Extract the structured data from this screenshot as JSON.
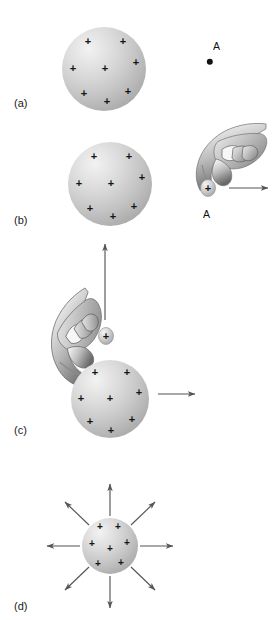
{
  "figure": {
    "background_color": "#ffffff",
    "sphere_light_color": "#f2f2f2",
    "sphere_dark_color": "#9a9a9a",
    "ink_color": "#141414",
    "arrow_color": "#555555"
  },
  "panels": [
    {
      "id": "a",
      "label": "(a)",
      "label_x": 14,
      "label_y": 97,
      "sphere": {
        "cx": 104,
        "cy": 69,
        "r": 42
      },
      "charges": [
        {
          "x": 88,
          "y": 41,
          "size": 11
        },
        {
          "x": 123,
          "y": 41,
          "size": 11
        },
        {
          "x": 73,
          "y": 68,
          "size": 11
        },
        {
          "x": 105,
          "y": 68,
          "size": 11
        },
        {
          "x": 136,
          "y": 62,
          "size": 11
        },
        {
          "x": 84,
          "y": 93,
          "size": 11
        },
        {
          "x": 128,
          "y": 91,
          "size": 11
        },
        {
          "x": 107,
          "y": 101,
          "size": 11
        }
      ],
      "markers": [
        {
          "name": "point-a",
          "label": "A",
          "label_x": 213,
          "label_y": 40,
          "dot_x": 210,
          "dot_y": 62,
          "dot_r": 3.2
        }
      ],
      "arrows": [],
      "hands": []
    },
    {
      "id": "b",
      "label": "(b)",
      "label_x": 14,
      "label_y": 214,
      "sphere": {
        "cx": 110,
        "cy": 184,
        "r": 42
      },
      "charges": [
        {
          "x": 94,
          "y": 156,
          "size": 11
        },
        {
          "x": 129,
          "y": 156,
          "size": 11
        },
        {
          "x": 79,
          "y": 183,
          "size": 11
        },
        {
          "x": 111,
          "y": 183,
          "size": 11
        },
        {
          "x": 142,
          "y": 177,
          "size": 11
        },
        {
          "x": 90,
          "y": 208,
          "size": 11
        },
        {
          "x": 134,
          "y": 206,
          "size": 11
        },
        {
          "x": 113,
          "y": 216,
          "size": 11
        }
      ],
      "markers": [
        {
          "name": "point-a",
          "label": "A",
          "label_x": 203,
          "label_y": 208,
          "dot_x": null,
          "dot_y": null,
          "dot_r": 0
        }
      ],
      "arrows": [
        {
          "name": "force-arrow-right",
          "x1": 229,
          "y1": 188,
          "x2": 268,
          "y2": 188
        }
      ],
      "hands": [
        {
          "name": "hand-holding-test-charge",
          "x": 188,
          "y": 120,
          "w": 80,
          "h": 78,
          "rotation": 0,
          "charge_x": 208,
          "charge_y": 188,
          "charge_size": 11
        }
      ]
    },
    {
      "id": "c",
      "label": "(c)",
      "label_x": 14,
      "label_y": 424,
      "sphere": {
        "cx": 110,
        "cy": 399,
        "r": 39
      },
      "charges": [
        {
          "x": 95,
          "y": 372,
          "size": 11
        },
        {
          "x": 127,
          "y": 372,
          "size": 11
        },
        {
          "x": 81,
          "y": 398,
          "size": 11
        },
        {
          "x": 110,
          "y": 398,
          "size": 11
        },
        {
          "x": 139,
          "y": 392,
          "size": 11
        },
        {
          "x": 90,
          "y": 421,
          "size": 11
        },
        {
          "x": 132,
          "y": 419,
          "size": 11
        },
        {
          "x": 111,
          "y": 430,
          "size": 11
        }
      ],
      "markers": [],
      "arrows": [
        {
          "name": "motion-arrow-up",
          "x1": 105,
          "y1": 320,
          "x2": 105,
          "y2": 244
        },
        {
          "name": "force-arrow-right",
          "x1": 158,
          "y1": 394,
          "x2": 195,
          "y2": 394
        }
      ],
      "hands": [
        {
          "name": "hand-holding-test-charge",
          "x": 36,
          "y": 300,
          "w": 82,
          "h": 82,
          "rotation": -38,
          "charge_x": 106,
          "charge_y": 336,
          "charge_size": 11
        }
      ]
    },
    {
      "id": "d",
      "label": "(d)",
      "label_x": 14,
      "label_y": 600,
      "sphere": {
        "cx": 110,
        "cy": 546,
        "r": 28
      },
      "charges": [
        {
          "x": 100,
          "y": 527,
          "size": 10
        },
        {
          "x": 118,
          "y": 527,
          "size": 10
        },
        {
          "x": 92,
          "y": 544,
          "size": 10
        },
        {
          "x": 110,
          "y": 549,
          "size": 10
        },
        {
          "x": 127,
          "y": 543,
          "size": 10
        },
        {
          "x": 98,
          "y": 564,
          "size": 10
        },
        {
          "x": 121,
          "y": 563,
          "size": 10
        }
      ],
      "markers": [],
      "arrows": [
        {
          "name": "field-arrow-n",
          "x1": 110,
          "y1": 516,
          "x2": 110,
          "y2": 484
        },
        {
          "name": "field-arrow-ne",
          "x1": 131,
          "y1": 525,
          "x2": 155,
          "y2": 502
        },
        {
          "name": "field-arrow-e",
          "x1": 140,
          "y1": 546,
          "x2": 173,
          "y2": 546
        },
        {
          "name": "field-arrow-se",
          "x1": 131,
          "y1": 567,
          "x2": 155,
          "y2": 590
        },
        {
          "name": "field-arrow-s",
          "x1": 110,
          "y1": 576,
          "x2": 110,
          "y2": 608
        },
        {
          "name": "field-arrow-sw",
          "x1": 89,
          "y1": 567,
          "x2": 65,
          "y2": 590
        },
        {
          "name": "field-arrow-w",
          "x1": 80,
          "y1": 546,
          "x2": 47,
          "y2": 546
        },
        {
          "name": "field-arrow-nw",
          "x1": 89,
          "y1": 525,
          "x2": 65,
          "y2": 502
        }
      ],
      "hands": []
    }
  ]
}
